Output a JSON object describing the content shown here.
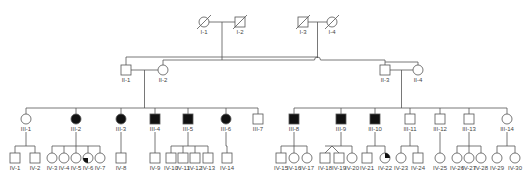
{
  "diagram": {
    "type": "pedigree",
    "colors": {
      "line": "#555555",
      "affected": "#111111",
      "unaffected": "#ffffff"
    },
    "legend_note": "square = male, circle = female, filled = affected, slash = deceased, quadrant fill = partial/carrier, diagonal sibling lines = twins",
    "generations": {
      "I": [
        {
          "id": "I-1",
          "label": "I-1",
          "sex": "female",
          "affected": false,
          "deceased": true,
          "x": 204
        },
        {
          "id": "I-2",
          "label": "I-2",
          "sex": "male",
          "affected": false,
          "deceased": true,
          "x": 240
        },
        {
          "id": "I-3",
          "label": "I-3",
          "sex": "male",
          "affected": false,
          "deceased": true,
          "x": 303
        },
        {
          "id": "I-4",
          "label": "I-4",
          "sex": "female",
          "affected": false,
          "deceased": true,
          "x": 332
        }
      ],
      "II": [
        {
          "id": "II-1",
          "label": "II-1",
          "sex": "male",
          "affected": false,
          "x": 126
        },
        {
          "id": "II-2",
          "label": "II-2",
          "sex": "female",
          "affected": false,
          "x": 163
        },
        {
          "id": "II-3",
          "label": "II-3",
          "sex": "male",
          "affected": false,
          "x": 385
        },
        {
          "id": "II-4",
          "label": "II-4",
          "sex": "female",
          "affected": false,
          "x": 418
        }
      ],
      "III": [
        {
          "id": "III-1",
          "label": "III-1",
          "sex": "female",
          "affected": false,
          "x": 26
        },
        {
          "id": "III-2",
          "label": "III-2",
          "sex": "female",
          "affected": true,
          "x": 76
        },
        {
          "id": "III-3",
          "label": "III-3",
          "sex": "female",
          "affected": true,
          "x": 121
        },
        {
          "id": "III-4",
          "label": "III-4",
          "sex": "male",
          "affected": true,
          "x": 155
        },
        {
          "id": "III-5",
          "label": "III-5",
          "sex": "male",
          "affected": true,
          "x": 188
        },
        {
          "id": "III-6",
          "label": "III-6",
          "sex": "female",
          "affected": true,
          "x": 226
        },
        {
          "id": "III-7",
          "label": "III-7",
          "sex": "male",
          "affected": false,
          "x": 258
        },
        {
          "id": "III-8",
          "label": "III-8",
          "sex": "male",
          "affected": true,
          "x": 294
        },
        {
          "id": "III-9",
          "label": "III-9",
          "sex": "male",
          "affected": true,
          "x": 341
        },
        {
          "id": "III-10",
          "label": "III-10",
          "sex": "male",
          "affected": true,
          "x": 375
        },
        {
          "id": "III-11",
          "label": "III-11",
          "sex": "male",
          "affected": false,
          "x": 410
        },
        {
          "id": "III-12",
          "label": "III-12",
          "sex": "male",
          "affected": false,
          "x": 440
        },
        {
          "id": "III-13",
          "label": "III-13",
          "sex": "male",
          "affected": false,
          "x": 469
        },
        {
          "id": "III-14",
          "label": "III-14",
          "sex": "female",
          "affected": false,
          "x": 507
        }
      ],
      "IV": [
        {
          "id": "IV-1",
          "label": "IV-1",
          "sex": "male",
          "x": 15,
          "parent": "III-1"
        },
        {
          "id": "IV-2",
          "label": "IV-2",
          "sex": "male",
          "x": 35,
          "parent": "III-1"
        },
        {
          "id": "IV-3",
          "label": "IV-3",
          "sex": "female",
          "x": 52,
          "parent": "III-2"
        },
        {
          "id": "IV-4",
          "label": "IV-4",
          "sex": "female",
          "x": 64,
          "parent": "III-2"
        },
        {
          "id": "IV-5",
          "label": "IV-5",
          "sex": "female",
          "x": 76,
          "parent": "III-2"
        },
        {
          "id": "IV-6",
          "label": "IV-6",
          "sex": "female",
          "x": 88,
          "parent": "III-2",
          "quadrant": "bottom-left"
        },
        {
          "id": "IV-7",
          "label": "IV-7",
          "sex": "female",
          "x": 100,
          "parent": "III-2"
        },
        {
          "id": "IV-8",
          "label": "IV-8",
          "sex": "male",
          "x": 121,
          "parent": "III-3"
        },
        {
          "id": "IV-9",
          "label": "IV-9",
          "sex": "male",
          "x": 155,
          "parent": "III-4"
        },
        {
          "id": "IV-10",
          "label": "IV-10",
          "sex": "male",
          "x": 171,
          "parent": "III-5"
        },
        {
          "id": "IV-11",
          "label": "IV-11",
          "sex": "male",
          "x": 183,
          "parent": "III-5"
        },
        {
          "id": "IV-12",
          "label": "IV-12",
          "sex": "male",
          "x": 195,
          "parent": "III-5"
        },
        {
          "id": "IV-13",
          "label": "IV-13",
          "sex": "male",
          "x": 208,
          "parent": "III-5"
        },
        {
          "id": "IV-14",
          "label": "IV-14",
          "sex": "male",
          "x": 227,
          "parent": "III-6"
        },
        {
          "id": "IV-15",
          "label": "IV-15",
          "sex": "male",
          "x": 281,
          "parent": "III-8"
        },
        {
          "id": "IV-16",
          "label": "IV-16",
          "sex": "female",
          "x": 294,
          "parent": "III-8"
        },
        {
          "id": "IV-17",
          "label": "IV-17",
          "sex": "female",
          "x": 307,
          "parent": "III-8"
        },
        {
          "id": "IV-18",
          "label": "IV-18",
          "sex": "male",
          "x": 325,
          "parent": "III-9",
          "twin": "a"
        },
        {
          "id": "IV-19",
          "label": "IV-19",
          "sex": "male",
          "x": 339,
          "parent": "III-9",
          "twin": "a"
        },
        {
          "id": "IV-20",
          "label": "IV-20",
          "sex": "female",
          "x": 352,
          "parent": "III-9"
        },
        {
          "id": "IV-21",
          "label": "IV-21",
          "sex": "male",
          "x": 367,
          "parent": "III-10"
        },
        {
          "id": "IV-22",
          "label": "IV-22",
          "sex": "female",
          "x": 385,
          "parent": "III-10",
          "quadrant": "top-right"
        },
        {
          "id": "IV-23",
          "label": "IV-23",
          "sex": "female",
          "x": 401,
          "parent": "III-11"
        },
        {
          "id": "IV-24",
          "label": "IV-24",
          "sex": "male",
          "x": 418,
          "parent": "III-11"
        },
        {
          "id": "IV-25",
          "label": "IV-25",
          "sex": "female",
          "x": 440,
          "parent": "III-12"
        },
        {
          "id": "IV-26",
          "label": "IV-26",
          "sex": "female",
          "x": 457,
          "parent": "III-13"
        },
        {
          "id": "IV-27",
          "label": "IV-27",
          "sex": "female",
          "x": 469,
          "parent": "III-13"
        },
        {
          "id": "IV-28",
          "label": "IV-28",
          "sex": "female",
          "x": 481,
          "parent": "III-13"
        },
        {
          "id": "IV-29",
          "label": "IV-29",
          "sex": "female",
          "x": 497,
          "parent": "III-14"
        },
        {
          "id": "IV-30",
          "label": "IV-30",
          "sex": "female",
          "x": 515,
          "parent": "III-14"
        }
      ]
    }
  }
}
